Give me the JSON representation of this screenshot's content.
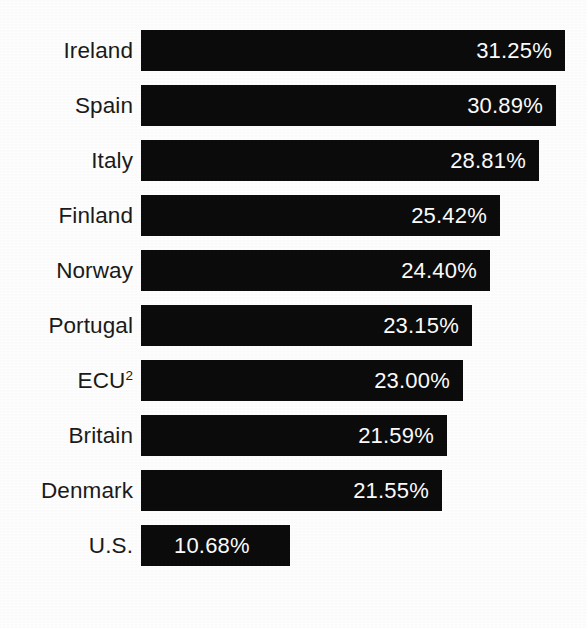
{
  "chart_data": {
    "type": "bar",
    "orientation": "horizontal",
    "title": "",
    "subtitle": "",
    "xlabel": "",
    "ylabel": "",
    "grid": false,
    "legend": "none",
    "axis_visible": false,
    "xlim": [
      0,
      36
    ],
    "value_format": "percent",
    "bar_color": "#0c0c0c",
    "background_color": "#fefefe",
    "label_color": "#1b1b1b",
    "value_color": "#fdfdfd",
    "categories": [
      "Ireland",
      "Spain",
      "Italy",
      "Finland",
      "Norway",
      "Portugal",
      "ECU",
      "Britain",
      "Denmark",
      "U.S."
    ],
    "values": [
      31.25,
      30.89,
      28.81,
      25.42,
      24.4,
      23.15,
      23.0,
      21.59,
      21.55,
      10.68
    ],
    "value_labels": [
      "31.25%",
      "30.89%",
      "28.81%",
      "25.42%",
      "24.40%",
      "23.15%",
      "23.00%",
      "21.59%",
      "21.55%",
      "10.68%"
    ]
  },
  "rows": [
    {
      "label": "Ireland",
      "label_sup": "",
      "value_label": "31.25%",
      "value": 31.25,
      "bar_px": 424,
      "label_inside_left": false
    },
    {
      "label": "Spain",
      "label_sup": "",
      "value_label": "30.89%",
      "value": 30.89,
      "bar_px": 415,
      "label_inside_left": false
    },
    {
      "label": "Italy",
      "label_sup": "",
      "value_label": "28.81%",
      "value": 28.81,
      "bar_px": 398,
      "label_inside_left": false
    },
    {
      "label": "Finland",
      "label_sup": "",
      "value_label": "25.42%",
      "value": 25.42,
      "bar_px": 359,
      "label_inside_left": false
    },
    {
      "label": "Norway",
      "label_sup": "",
      "value_label": "24.40%",
      "value": 24.4,
      "bar_px": 349,
      "label_inside_left": false
    },
    {
      "label": "Portugal",
      "label_sup": "",
      "value_label": "23.15%",
      "value": 23.15,
      "bar_px": 331,
      "label_inside_left": false
    },
    {
      "label": "ECU",
      "label_sup": "2",
      "value_label": "23.00%",
      "value": 23.0,
      "bar_px": 322,
      "label_inside_left": false
    },
    {
      "label": "Britain",
      "label_sup": "",
      "value_label": "21.59%",
      "value": 21.59,
      "bar_px": 306,
      "label_inside_left": false
    },
    {
      "label": "Denmark",
      "label_sup": "",
      "value_label": "21.55%",
      "value": 21.55,
      "bar_px": 301,
      "label_inside_left": false
    },
    {
      "label": "U.S.",
      "label_sup": "",
      "value_label": "10.68%",
      "value": 10.68,
      "bar_px": 149,
      "label_inside_left": true
    }
  ],
  "layout": {
    "bar_left_px": 141,
    "bar_height_px": 41,
    "row_pitch_px": 55,
    "first_row_top_px": 30,
    "label_column_width_px": 133
  }
}
